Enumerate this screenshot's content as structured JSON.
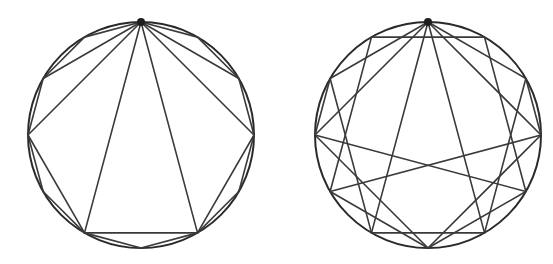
{
  "figures": [
    {
      "name": "left-circle-figure",
      "center": [
        141,
        135
      ],
      "radius": 113,
      "marked_vertex_deg": 0,
      "stroke_color": "#2a2a2a",
      "chords_deg": [
        [
          0,
          60
        ],
        [
          0,
          90
        ],
        [
          0,
          150
        ],
        [
          0,
          210
        ],
        [
          0,
          270
        ],
        [
          0,
          300
        ],
        [
          0,
          30
        ],
        [
          30,
          60
        ],
        [
          0,
          330
        ],
        [
          330,
          300
        ],
        [
          60,
          90
        ],
        [
          300,
          270
        ],
        [
          90,
          150
        ],
        [
          90,
          120
        ],
        [
          120,
          150
        ],
        [
          270,
          210
        ],
        [
          270,
          240
        ],
        [
          240,
          210
        ],
        [
          150,
          210
        ],
        [
          150,
          180
        ],
        [
          180,
          210
        ]
      ]
    },
    {
      "name": "right-circle-figure",
      "center": [
        428,
        135
      ],
      "radius": 113,
      "marked_vertex_deg": 0,
      "stroke_color": "#2a2a2a",
      "chords_deg": [
        [
          0,
          150
        ],
        [
          0,
          210
        ],
        [
          0,
          300
        ],
        [
          0,
          60
        ],
        [
          0,
          90
        ],
        [
          0,
          270
        ],
        [
          330,
          30
        ],
        [
          150,
          210
        ],
        [
          330,
          240
        ],
        [
          30,
          120
        ],
        [
          300,
          210
        ],
        [
          60,
          150
        ],
        [
          270,
          180
        ],
        [
          90,
          180
        ],
        [
          300,
          270
        ],
        [
          60,
          90
        ],
        [
          240,
          180
        ],
        [
          120,
          180
        ],
        [
          270,
          120
        ],
        [
          90,
          240
        ]
      ]
    }
  ]
}
